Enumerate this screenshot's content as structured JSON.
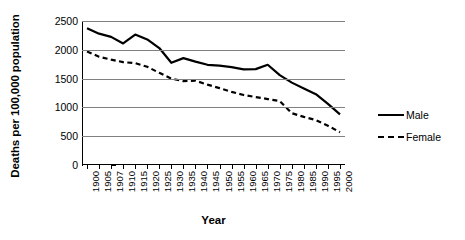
{
  "chart_data": {
    "type": "line",
    "title": "",
    "xlabel": "Year",
    "ylabel": "Deaths per 100,000 population",
    "categories": [
      "1900",
      "1905",
      "1907",
      "1910",
      "1915",
      "1920",
      "1925",
      "1930",
      "1935",
      "1940",
      "1945",
      "1950",
      "1955",
      "1960",
      "1965",
      "1970",
      "1975",
      "1980",
      "1985",
      "1990",
      "1995",
      "2000"
    ],
    "series": [
      {
        "name": "Male",
        "style": "solid",
        "values": [
          2375,
          2280,
          2225,
          2110,
          2265,
          2180,
          2030,
          1775,
          1855,
          1795,
          1740,
          1725,
          1700,
          1660,
          1665,
          1740,
          1560,
          1430,
          1330,
          1230,
          1060,
          880
        ]
      },
      {
        "name": "Female",
        "style": "dashed",
        "values": [
          1970,
          1880,
          1830,
          1785,
          1770,
          1705,
          1600,
          1500,
          1455,
          1465,
          1395,
          1335,
          1270,
          1215,
          1180,
          1145,
          1110,
          900,
          835,
          780,
          680,
          570
        ]
      }
    ],
    "ylim": [
      0,
      2500
    ],
    "yticks": [
      0,
      500,
      1000,
      1500,
      2000,
      2500
    ],
    "ytick_labels": [
      "0",
      "500",
      "1000",
      "1500",
      "2000",
      "2500"
    ],
    "grid": true,
    "legend_position": "right",
    "colors": {
      "line": "#000000",
      "grid": "#808080",
      "axis": "#000000",
      "background": "#ffffff"
    }
  },
  "legend": {
    "items": [
      {
        "label": "Male",
        "style": "solid"
      },
      {
        "label": "Female",
        "style": "dashed"
      }
    ]
  }
}
